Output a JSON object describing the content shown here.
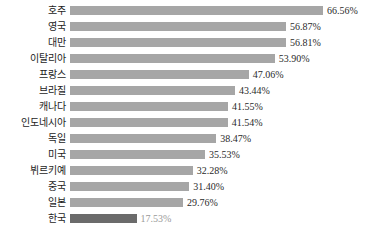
{
  "chart_data": {
    "type": "bar",
    "orientation": "horizontal",
    "title": "",
    "subtitle": "",
    "xlabel": "",
    "ylabel": "",
    "grid": false,
    "legend": false,
    "value_suffix": "%",
    "xlim": [
      0,
      66.56
    ],
    "categories": [
      "호주",
      "영국",
      "대만",
      "이탈리아",
      "프랑스",
      "브라질",
      "캐나다",
      "인도네시아",
      "독일",
      "미국",
      "뷔르키예",
      "중국",
      "일본",
      "한국"
    ],
    "values": [
      66.56,
      56.87,
      56.81,
      53.9,
      47.06,
      43.44,
      41.55,
      41.54,
      38.47,
      35.53,
      32.28,
      31.4,
      29.76,
      17.53
    ],
    "value_labels": [
      "66.56%",
      "56.87%",
      "56.81%",
      "53.90%",
      "47.06%",
      "43.44%",
      "41.55%",
      "41.54%",
      "38.47%",
      "35.53%",
      "32.28%",
      "31.40%",
      "29.76%",
      "17.53%"
    ],
    "colors": {
      "bar": "#a6a6a6",
      "highlight_bar": "#6b6b6b",
      "label_text": "#1c1c1c",
      "value_text": "#2a2a2a",
      "highlight_value_text": "#9a9a9a",
      "background": "#ffffff"
    },
    "highlight_index": 13
  },
  "rows": [
    {
      "label": "호주",
      "value": 66.56,
      "value_label": "66.56%",
      "highlight": false
    },
    {
      "label": "영국",
      "value": 56.87,
      "value_label": "56.87%",
      "highlight": false
    },
    {
      "label": "대만",
      "value": 56.81,
      "value_label": "56.81%",
      "highlight": false
    },
    {
      "label": "이탈리아",
      "value": 53.9,
      "value_label": "53.90%",
      "highlight": false
    },
    {
      "label": "프랑스",
      "value": 47.06,
      "value_label": "47.06%",
      "highlight": false
    },
    {
      "label": "브라질",
      "value": 43.44,
      "value_label": "43.44%",
      "highlight": false
    },
    {
      "label": "캐나다",
      "value": 41.55,
      "value_label": "41.55%",
      "highlight": false
    },
    {
      "label": "인도네시아",
      "value": 41.54,
      "value_label": "41.54%",
      "highlight": false
    },
    {
      "label": "독일",
      "value": 38.47,
      "value_label": "38.47%",
      "highlight": false
    },
    {
      "label": "미국",
      "value": 35.53,
      "value_label": "35.53%",
      "highlight": false
    },
    {
      "label": "뷔르키예",
      "value": 32.28,
      "value_label": "32.28%",
      "highlight": false
    },
    {
      "label": "중국",
      "value": 31.4,
      "value_label": "31.40%",
      "highlight": false
    },
    {
      "label": "일본",
      "value": 29.76,
      "value_label": "29.76%",
      "highlight": false
    },
    {
      "label": "한국",
      "value": 17.53,
      "value_label": "17.53%",
      "highlight": true
    }
  ]
}
